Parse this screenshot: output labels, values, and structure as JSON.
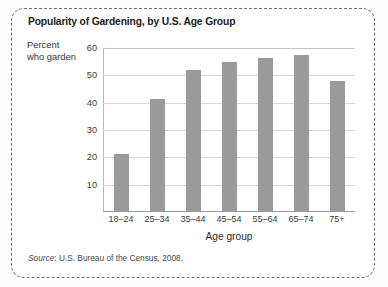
{
  "figure": {
    "title": "Popularity of Gardening, by U.S. Age Group",
    "y_caption_line1": "Percent",
    "y_caption_line2": "who garden",
    "source_prefix": "Source",
    "source_text": ": U.S. Bureau of the Census, 2008.",
    "border_color": "#6d6d6d",
    "bar_color": "#9a9a9a",
    "grid_color": "#d7d7d7"
  },
  "chart_data": {
    "type": "bar",
    "title": "Popularity of Gardening, by U.S. Age Group",
    "xlabel": "Age group",
    "ylabel": "Percent who garden",
    "categories": [
      "18–24",
      "25–34",
      "35–44",
      "45–54",
      "55–64",
      "65–74",
      "75+"
    ],
    "values": [
      21,
      41,
      51.5,
      54.5,
      56,
      57,
      47.5
    ],
    "ylim": [
      0,
      60
    ],
    "yticks": [
      10,
      20,
      30,
      40,
      50,
      60
    ],
    "ytick_labels": [
      "10",
      "20",
      "30",
      "40",
      "50",
      "60"
    ],
    "grid": true,
    "grid_axis": "y",
    "legend": false,
    "source": "Source: U.S. Bureau of the Census, 2008."
  }
}
